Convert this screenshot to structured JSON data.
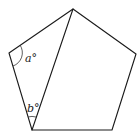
{
  "diagram": {
    "type": "geometry",
    "shape": "regular pentagon with one diagonal",
    "colors": {
      "stroke": "#1a1a1a",
      "background": "#ffffff",
      "label": "#222222"
    },
    "vertices": {
      "top": [
        73,
        9
      ],
      "right": [
        136,
        54
      ],
      "bottom_right": [
        112,
        130
      ],
      "bottom_left": [
        32,
        130
      ],
      "left": [
        9,
        53
      ]
    },
    "diagonal": {
      "from": "bottom_left",
      "to": "top"
    },
    "angles": [
      {
        "label": "a°",
        "vertex": "left",
        "position": [
          25,
          62
        ]
      },
      {
        "label": "b°",
        "vertex": "bottom_left",
        "position": [
          28,
          113
        ]
      }
    ]
  }
}
